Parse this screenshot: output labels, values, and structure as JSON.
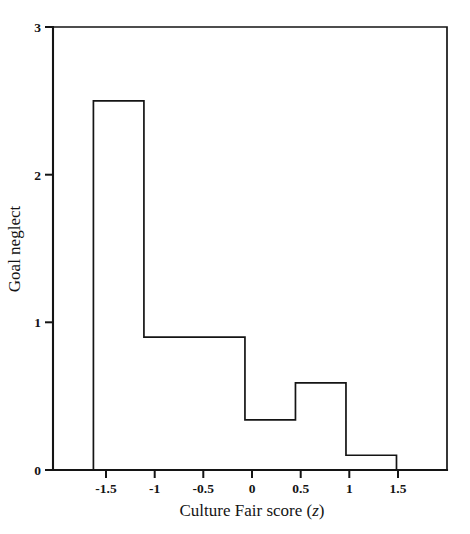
{
  "chart_data": {
    "type": "bar",
    "title": "",
    "subtitle": "",
    "xlabel": "Culture Fair score (z)",
    "ylabel": "Goal neglect",
    "xlim": [
      -1.9,
      2.0
    ],
    "ylim": [
      0,
      3
    ],
    "grid": false,
    "legend": null,
    "bin_edges": [
      -1.5,
      -1.0,
      -0.5,
      0.0,
      0.5,
      1.0,
      1.5
    ],
    "categories": [
      "-1.5 to -1",
      "-1 to -0.5",
      "-0.5 to 0",
      "0 to 0.5",
      "0.5 to 1",
      "1 to 1.5"
    ],
    "values": [
      2.5,
      0.9,
      0.9,
      0.34,
      0.59,
      0.1
    ],
    "xticks": [
      -1.5,
      -1,
      -0.5,
      0,
      0.5,
      1,
      1.5
    ],
    "xticklabels": [
      "-1.5",
      "-1",
      "-0.5",
      "0",
      "0.5",
      "1",
      "1.5"
    ],
    "yticks": [
      0,
      1,
      2,
      3
    ],
    "yticklabels": [
      "0",
      "1",
      "2",
      "3"
    ],
    "line_color": "#141414",
    "fill_color": "none",
    "background_color": "#ffffff",
    "annotations": []
  },
  "axis_title_x": {
    "main": "Culture Fair score (",
    "italic": "z",
    "tail": ")"
  }
}
